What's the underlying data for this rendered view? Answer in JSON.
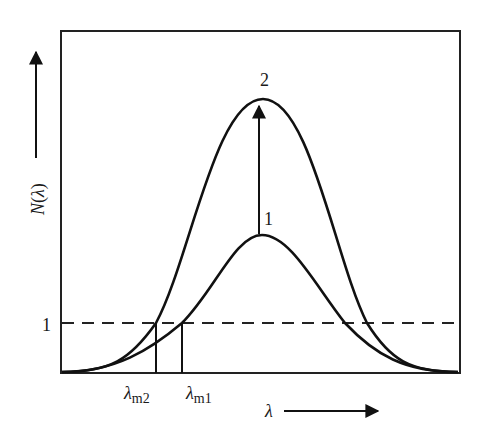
{
  "diagram": {
    "title": "",
    "y_axis": {
      "label": "N(λ)",
      "label_N": "N",
      "label_paren_open": "(",
      "label_lambda": "λ",
      "label_paren_close": ")"
    },
    "x_axis": {
      "label": "λ"
    },
    "threshold": {
      "label": "1"
    },
    "curves": [
      {
        "id": "curve-1",
        "label": "1"
      },
      {
        "id": "curve-2",
        "label": "2"
      }
    ],
    "markers": [
      {
        "id": "lambda-m2",
        "symbol": "λ",
        "subscript": "m2"
      },
      {
        "id": "lambda-m1",
        "symbol": "λ",
        "subscript": "m1"
      }
    ],
    "colors": {
      "stroke": "#111111",
      "background": "#ffffff"
    }
  }
}
